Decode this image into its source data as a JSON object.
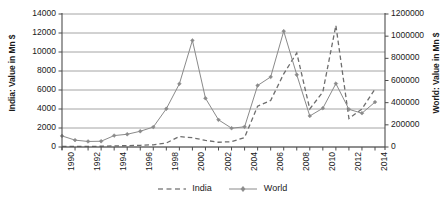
{
  "chart_data": {
    "type": "line",
    "title": "",
    "xlabel": "",
    "x": [
      1990,
      1991,
      1992,
      1993,
      1994,
      1995,
      1996,
      1997,
      1998,
      1999,
      2000,
      2001,
      2002,
      2003,
      2004,
      2005,
      2006,
      2007,
      2008,
      2009,
      2010,
      2011,
      2012,
      2013,
      2014
    ],
    "x_tick_labels": [
      "1990",
      "1992",
      "1994",
      "1996",
      "1998",
      "2000",
      "2002",
      "2004",
      "2006",
      "2008",
      "2010",
      "2012",
      "2014"
    ],
    "grid": true,
    "legend_position": "bottom",
    "series": [
      {
        "name": "India",
        "axis": "left",
        "style": "dashed",
        "marker": "none",
        "color": "#6e6e6e",
        "values": [
          60,
          70,
          60,
          80,
          120,
          140,
          180,
          230,
          420,
          1100,
          980,
          700,
          500,
          560,
          1000,
          4300,
          4900,
          7700,
          9900,
          4000,
          5800,
          12800,
          3000,
          4000,
          6100
        ]
      },
      {
        "name": "World",
        "axis": "right",
        "style": "solid",
        "marker": "diamond",
        "color": "#8a8a8a",
        "values": [
          100000,
          62000,
          50000,
          52000,
          103000,
          115000,
          142000,
          180000,
          345000,
          570000,
          962000,
          440000,
          245000,
          170000,
          182000,
          555000,
          632000,
          1045000,
          652000,
          280000,
          350000,
          572000,
          340000,
          305000,
          405000
        ]
      }
    ],
    "axes": {
      "left": {
        "label": "India: Value in Mn $",
        "min": 0,
        "max": 14000,
        "step": 2000,
        "tick_labels": [
          "0",
          "2000",
          "4000",
          "6000",
          "8000",
          "10000",
          "12000",
          "14000"
        ]
      },
      "right": {
        "label": "World: Value in Mn $",
        "min": 0,
        "max": 1200000,
        "step": 200000,
        "tick_labels": [
          "0",
          "200000",
          "400000",
          "600000",
          "800000",
          "1000000",
          "1200000"
        ]
      }
    }
  },
  "legend": {
    "items": [
      {
        "label": "India"
      },
      {
        "label": "World"
      }
    ]
  },
  "colors": {
    "line_india": "#6e6e6e",
    "line_world": "#8a8a8a",
    "gridline": "#9a9a9a",
    "axis": "#4d4d4d",
    "text": "#1a1a1a"
  }
}
